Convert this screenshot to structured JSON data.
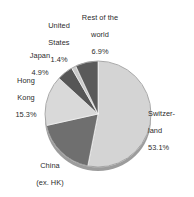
{
  "chart_data": {
    "type": "pie",
    "title": "",
    "subtitle": "",
    "xlabel": "",
    "ylabel": "",
    "legend_position": "none",
    "grid": false,
    "unit": "%",
    "categories": [
      "Switzerland",
      "China (ex. HK)",
      "Hong Kong",
      "Japan",
      "United States",
      "Rest of the world"
    ],
    "values": [
      53.1,
      18.4,
      15.3,
      4.9,
      1.4,
      6.9
    ],
    "colors": [
      "#d4d4d4",
      "#6f6f6f",
      "#d9d9d9",
      "#565656",
      "#c9c9c9",
      "#5a5a5a"
    ],
    "slices": [
      {
        "name": "Switzerland",
        "label_line1": "Switzer-",
        "label_line2": "land",
        "value": 53.1,
        "value_text": "53.1%",
        "color": "#d4d4d4"
      },
      {
        "name": "China (ex. HK)",
        "label_line1": "China",
        "label_line2": "(ex. HK)",
        "value": 18.4,
        "value_text": "18.4%",
        "color": "#6f6f6f"
      },
      {
        "name": "Hong Kong",
        "label_line1": "Hong",
        "label_line2": "Kong",
        "value": 15.3,
        "value_text": "15.3%",
        "color": "#d9d9d9"
      },
      {
        "name": "Japan",
        "label_line1": "Japan",
        "label_line2": "",
        "value": 4.9,
        "value_text": "4.9%",
        "color": "#565656"
      },
      {
        "name": "United States",
        "label_line1": "United",
        "label_line2": "States",
        "value": 1.4,
        "value_text": "1.4%",
        "color": "#c9c9c9"
      },
      {
        "name": "Rest of the world",
        "label_line1": "Rest of the",
        "label_line2": "world",
        "value": 6.9,
        "value_text": "6.9%",
        "color": "#5a5a5a"
      }
    ]
  },
  "labels": {
    "united_states": {
      "line1": "United",
      "line2": "States",
      "value": "1.4%"
    },
    "rest_of_world": {
      "line1": "Rest of the",
      "line2": "world",
      "value": "6.9%"
    },
    "japan": {
      "line1": "Japan",
      "line2": "",
      "value": "4.9%"
    },
    "hong_kong": {
      "line1": "Hong",
      "line2": "Kong",
      "value": "15.3%"
    },
    "china": {
      "line1": "China",
      "line2": "(ex. HK)",
      "value": "18.4%"
    },
    "switzerland": {
      "line1": "Switzer-",
      "line2": "land",
      "value": "53.1%"
    }
  }
}
